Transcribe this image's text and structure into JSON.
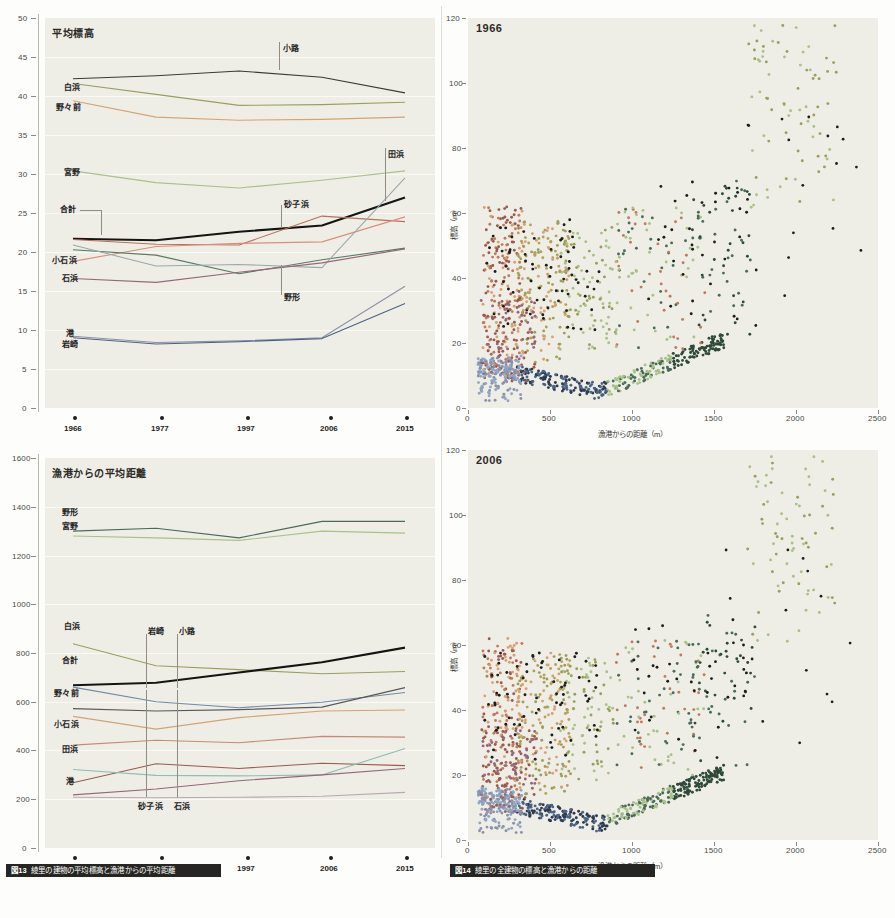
{
  "figure13": {
    "caption_id": "図13",
    "caption_text": "綾里の建物の平均標高と漁港からの平均距離",
    "chart_data": [
      {
        "type": "line",
        "title": "平均標高",
        "xlabel": "",
        "ylabel": "",
        "categories": [
          "1966",
          "1977",
          "1997",
          "2006",
          "2015"
        ],
        "ylim": [
          0,
          50
        ],
        "yticks": [
          0,
          5,
          10,
          15,
          20,
          25,
          30,
          35,
          40,
          45,
          50
        ],
        "grid": true,
        "legend_position": "inline-labels",
        "series": [
          {
            "name": "小路",
            "color": "#3b3a36",
            "values": [
              42.2,
              42.6,
              43.2,
              42.4,
              40.4
            ]
          },
          {
            "name": "白浜",
            "color": "#9aa05c",
            "values": [
              41.6,
              40.2,
              38.8,
              38.9,
              39.2
            ]
          },
          {
            "name": "野々前",
            "color": "#d6a273",
            "values": [
              39.4,
              37.3,
              36.9,
              37.0,
              37.3
            ]
          },
          {
            "name": "宮野",
            "color": "#a8c287",
            "values": [
              30.4,
              28.9,
              28.2,
              29.2,
              30.4
            ]
          },
          {
            "name": "合計",
            "color": "#141412",
            "values": [
              21.7,
              21.5,
              22.6,
              23.4,
              27.0
            ]
          },
          {
            "name": "砂子浜",
            "color": "#b9705c",
            "values": [
              21.6,
              21.0,
              20.9,
              24.6,
              23.9
            ]
          },
          {
            "name": "小石浜",
            "color": "#d98f7c",
            "values": [
              18.8,
              20.7,
              21.1,
              21.3,
              24.5
            ]
          },
          {
            "name": "野形",
            "color": "#587a64",
            "values": [
              20.3,
              19.6,
              17.2,
              19.0,
              20.5
            ]
          },
          {
            "name": "田浜",
            "color": "#9aa9ae",
            "values": [
              20.9,
              18.2,
              18.4,
              18.0,
              29.5
            ]
          },
          {
            "name": "石浜",
            "color": "#97667a",
            "values": [
              16.6,
              16.1,
              17.4,
              18.6,
              20.4
            ]
          },
          {
            "name": "港",
            "color": "#8f8fa8",
            "values": [
              9.2,
              8.4,
              8.6,
              9.0,
              15.6
            ]
          },
          {
            "name": "岩崎",
            "color": "#4a6484",
            "values": [
              9.0,
              8.2,
              8.5,
              8.9,
              13.4
            ]
          }
        ],
        "annotations": [
          {
            "label": "小路",
            "x": 2.55,
            "y": 46.4
          },
          {
            "label": "田浜",
            "x": 4.55,
            "y": 32.4
          },
          {
            "label": "砂子浜",
            "x": 2.8,
            "y": 26.3
          },
          {
            "label": "野形",
            "x": 2.8,
            "y": 14.2
          },
          {
            "label": "合計",
            "x": 0.0,
            "y": 25.6
          }
        ],
        "left_labels": [
          {
            "label": "白浜",
            "y": 41.6
          },
          {
            "label": "野々前",
            "y": 39.4
          },
          {
            "label": "宮野",
            "y": 30.4
          },
          {
            "label": "小石浜",
            "y": 18.8
          },
          {
            "label": "石浜",
            "y": 16.6
          },
          {
            "label": "港",
            "y": 9.8
          },
          {
            "label": "岩崎",
            "y": 8.5
          }
        ]
      },
      {
        "type": "line",
        "title": "漁港からの平均距離",
        "xlabel": "",
        "ylabel": "",
        "categories": [
          "1966",
          "1977",
          "1997",
          "2006",
          "2015"
        ],
        "ylim": [
          0,
          1600
        ],
        "yticks": [
          0,
          200,
          400,
          600,
          800,
          1000,
          1200,
          1400,
          1600
        ],
        "grid": true,
        "legend_position": "inline-labels",
        "series": [
          {
            "name": "野形",
            "color": "#4a6b5a",
            "values": [
              1300,
              1312,
              1272,
              1340,
              1340
            ]
          },
          {
            "name": "宮野",
            "color": "#a8c287",
            "values": [
              1280,
              1272,
              1262,
              1300,
              1292
            ]
          },
          {
            "name": "白浜",
            "color": "#9aa05c",
            "values": [
              838,
              748,
              732,
              715,
              724
            ]
          },
          {
            "name": "合計",
            "color": "#141412",
            "values": [
              668,
              678,
              720,
              762,
              822
            ]
          },
          {
            "name": "岩崎",
            "color": "#6e8aae",
            "values": [
              660,
              600,
              575,
              598,
              638
            ]
          },
          {
            "name": "小路",
            "color": "#58585a",
            "values": [
              572,
              562,
              568,
              578,
              658
            ]
          },
          {
            "name": "野々前",
            "color": "#d6a273",
            "values": [
              540,
              488,
              535,
              562,
              566
            ]
          },
          {
            "name": "小石浜",
            "color": "#c98877",
            "values": [
              422,
              442,
              432,
              458,
              455
            ]
          },
          {
            "name": "砂子浜",
            "color": "#9b5a4e",
            "values": [
              268,
              346,
              326,
              348,
              338
            ]
          },
          {
            "name": "田浜",
            "color": "#8fbcb4",
            "values": [
              322,
              298,
              296,
              300,
              408
            ]
          },
          {
            "name": "石浜",
            "color": "#97667a",
            "values": [
              218,
              242,
              276,
              300,
              326
            ]
          },
          {
            "name": "港",
            "color": "#b8a8b4",
            "values": [
              208,
              206,
              208,
              212,
              228
            ]
          }
        ],
        "annotations": [
          {
            "label": "岩崎",
            "x": 0.88,
            "y": 838
          },
          {
            "label": "小路",
            "x": 1.2,
            "y": 838
          },
          {
            "label": "砂子浜",
            "x": 0.88,
            "y": 112
          },
          {
            "label": "石浜",
            "x": 1.2,
            "y": 112
          }
        ],
        "left_labels": [
          {
            "label": "野形",
            "y": 1340
          },
          {
            "label": "宮野",
            "y": 1262
          },
          {
            "label": "白浜",
            "y": 838
          },
          {
            "label": "合計",
            "y": 672
          },
          {
            "label": "野々前",
            "y": 542
          },
          {
            "label": "小石浜",
            "y": 422
          },
          {
            "label": "田浜",
            "y": 322
          },
          {
            "label": "港",
            "y": 196
          }
        ]
      }
    ]
  },
  "figure14": {
    "caption_id": "図14",
    "caption_text": "綾里の全建物の標高と漁港からの距離",
    "chart_data": [
      {
        "type": "scatter",
        "title": "1966",
        "xlabel": "漁港からの距離（m）",
        "ylabel": "標高（m）",
        "xlim": [
          0,
          2500
        ],
        "ylim": [
          0,
          120
        ],
        "xticks": [
          0,
          500,
          1000,
          1500,
          2000,
          2500
        ],
        "yticks": [
          0,
          20,
          40,
          60,
          80,
          100,
          120
        ],
        "grid": false,
        "cluster_colors": [
          "#2e3a4e",
          "#4a6484",
          "#8fa6c4",
          "#7a9ab8",
          "#9b5a4e",
          "#c07a5c",
          "#d6a273",
          "#b8a05a",
          "#9aa05c",
          "#a8c287",
          "#4a6b5a",
          "#2e4a3a",
          "#1d1d1b",
          "#97667a",
          "#8f8fa8"
        ]
      },
      {
        "type": "scatter",
        "title": "2006",
        "xlabel": "漁港からの距離（m）",
        "ylabel": "標高（m）",
        "xlim": [
          0,
          2500
        ],
        "ylim": [
          0,
          120
        ],
        "xticks": [
          0,
          500,
          1000,
          1500,
          2000,
          2500
        ],
        "yticks": [
          0,
          20,
          40,
          60,
          80,
          100,
          120
        ],
        "grid": false,
        "cluster_colors": [
          "#2e3a4e",
          "#4a6484",
          "#8fa6c4",
          "#7a9ab8",
          "#9b5a4e",
          "#c07a5c",
          "#d6a273",
          "#b8a05a",
          "#9aa05c",
          "#a8c287",
          "#4a6b5a",
          "#2e4a3a",
          "#1d1d1b",
          "#97667a",
          "#8f8fa8"
        ]
      }
    ]
  }
}
